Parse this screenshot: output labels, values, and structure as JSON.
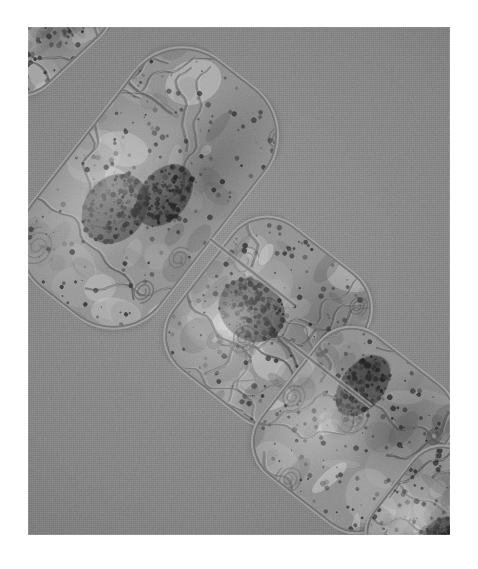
{
  "figure": {
    "kind": "transmission-electron-micrograph",
    "orientation": "diagonal, upper-left to lower-right",
    "background_color": "#7f7f7f",
    "margin_color": "#ffffff",
    "plate": {
      "x": 28,
      "y": 27,
      "width": 422,
      "height": 508
    },
    "alt_text": "Grayscale transmission electron micrograph showing a chain of three barrel-shaped cyanobacterial cells running diagonally across a uniform gray background, with two partial cells cut off at the upper-left and lower-right corners. Each cell shows concentric wavy thylakoid membranes, pale cytoplasmic regions and dark electron-dense granules."
  },
  "tones": {
    "background": "#7f7f7f",
    "cell_wall_light": "#a8a8a8",
    "cell_wall_dark": "#5d5d5d",
    "cytoplasm_mid": "#8b8b8b",
    "cytoplasm_light": "#c9c9c9",
    "thylakoid_membrane": "#5a5a5a",
    "dense_granule": "#2e2e2e",
    "darkest_body": "#1f1f1f"
  },
  "structures": [
    {
      "id": "cell-partial-top-left",
      "label": "partial cell (cropped, upper-left corner)",
      "center_x": 34,
      "center_y": 18,
      "width": 150,
      "height": 120,
      "rotation": -43,
      "corner_radius": 40,
      "completeness": "partial"
    },
    {
      "id": "cell-1",
      "label": "cell 1 (upper)",
      "center_x": 148,
      "center_y": 188,
      "width": 292,
      "height": 168,
      "rotation": -52,
      "corner_radius": 62,
      "completeness": "full",
      "features": [
        "thylakoid whorls",
        "carboxysome-like dark body",
        "polyphosphate granules"
      ]
    },
    {
      "id": "septum-1",
      "label": "septum between cell 1 and cell 2",
      "center_x": 253,
      "center_y": 272,
      "length": 108,
      "rotation": -52
    },
    {
      "id": "cell-2",
      "label": "cell 2 (middle)",
      "center_x": 268,
      "center_y": 322,
      "width": 186,
      "height": 168,
      "rotation": -52,
      "corner_radius": 46,
      "completeness": "full",
      "features": [
        "central dark electron-dense body",
        "concentric thylakoid arcs"
      ]
    },
    {
      "id": "septum-2",
      "label": "septum between cell 2 and cell 3",
      "center_x": 330,
      "center_y": 374,
      "length": 104,
      "rotation": -52
    },
    {
      "id": "cell-3",
      "label": "cell 3 (lower)",
      "center_x": 354,
      "center_y": 430,
      "width": 180,
      "height": 166,
      "rotation": -52,
      "corner_radius": 44,
      "completeness": "full",
      "features": [
        "dark granule cluster",
        "pale storage region",
        "thylakoid coils"
      ]
    },
    {
      "id": "cell-partial-bottom-right",
      "label": "partial cell (cropped, lower-right corner)",
      "center_x": 438,
      "center_y": 520,
      "width": 140,
      "height": 116,
      "rotation": -52,
      "corner_radius": 38,
      "completeness": "partial"
    }
  ],
  "annotations": {
    "scale_bar": null,
    "labels": [],
    "title": null,
    "caption": null
  }
}
